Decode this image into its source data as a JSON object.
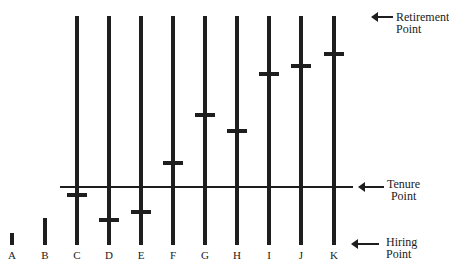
{
  "annotations": {
    "retirement": [
      "Retirement",
      "Point"
    ],
    "tenure": [
      "Tenure",
      "Point"
    ],
    "hiring": [
      "Hiring",
      "Point"
    ]
  },
  "bars": [
    {
      "label": "A",
      "x": 12,
      "top": 233,
      "tick": null
    },
    {
      "label": "B",
      "x": 45,
      "top": 218,
      "tick": null
    },
    {
      "label": "C",
      "x": 77,
      "top": 16,
      "tick": 195
    },
    {
      "label": "D",
      "x": 109,
      "top": 16,
      "tick": 220
    },
    {
      "label": "E",
      "x": 141,
      "top": 16,
      "tick": 212
    },
    {
      "label": "F",
      "x": 173,
      "top": 16,
      "tick": 163
    },
    {
      "label": "G",
      "x": 205,
      "top": 16,
      "tick": 115
    },
    {
      "label": "H",
      "x": 237,
      "top": 16,
      "tick": 131
    },
    {
      "label": "I",
      "x": 269,
      "top": 16,
      "tick": 74
    },
    {
      "label": "J",
      "x": 301,
      "top": 16,
      "tick": 66
    },
    {
      "label": "K",
      "x": 334,
      "top": 16,
      "tick": 54
    }
  ],
  "layout": {
    "bar_bottom": 245,
    "tenure_line_y": 187
  }
}
